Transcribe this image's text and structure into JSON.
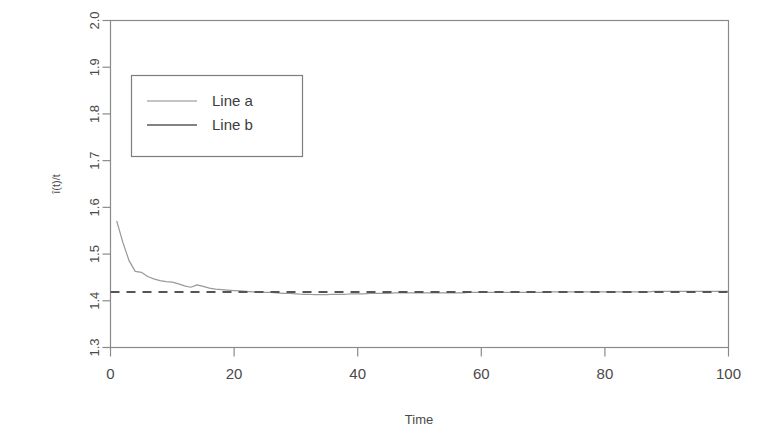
{
  "chart_data": {
    "type": "line",
    "title": "",
    "subtitle": "",
    "xlabel": "Time",
    "ylabel": "î(t)/t",
    "xlim": [
      0,
      100
    ],
    "ylim": [
      1.3,
      2.0
    ],
    "grid": false,
    "legend_position": "upper-left",
    "x_ticks": [
      "0",
      "20",
      "40",
      "60",
      "80",
      "100"
    ],
    "x_tick_values": [
      0,
      20,
      40,
      60,
      80,
      100
    ],
    "y_ticks": [
      "1.3",
      "1.4",
      "1.5",
      "1.6",
      "1.7",
      "1.8",
      "1.9",
      "2.0"
    ],
    "y_tick_values": [
      1.3,
      1.4,
      1.5,
      1.6,
      1.7,
      1.8,
      1.9,
      2.0
    ],
    "legend": [
      "Line a",
      "Line b"
    ],
    "series": [
      {
        "name": "Line a",
        "style": "solid",
        "color": "#9a9a9a",
        "x": [
          1,
          2,
          3,
          4,
          5,
          6,
          7,
          8,
          9,
          10,
          11,
          12,
          13,
          14,
          15,
          16,
          17,
          18,
          19,
          20,
          21,
          22,
          23,
          24,
          25,
          26,
          27,
          28,
          29,
          30,
          31,
          32,
          33,
          34,
          35,
          36,
          37,
          38,
          39,
          40,
          41,
          42,
          43,
          44,
          45,
          46,
          47,
          48,
          49,
          50,
          51,
          52,
          53,
          54,
          55,
          56,
          57,
          58,
          59,
          60,
          61,
          62,
          63,
          64,
          65,
          66,
          67,
          68,
          69,
          70,
          71,
          72,
          73,
          74,
          75,
          76,
          77,
          78,
          79,
          80,
          81,
          82,
          83,
          84,
          85,
          86,
          87,
          88,
          89,
          90,
          91,
          92,
          93,
          94,
          95,
          96,
          97,
          98,
          99,
          100
        ],
        "values": [
          1.571,
          1.525,
          1.486,
          1.463,
          1.461,
          1.452,
          1.447,
          1.443,
          1.441,
          1.44,
          1.436,
          1.432,
          1.429,
          1.434,
          1.431,
          1.427,
          1.425,
          1.424,
          1.423,
          1.422,
          1.421,
          1.42,
          1.419,
          1.419,
          1.418,
          1.418,
          1.417,
          1.416,
          1.416,
          1.415,
          1.414,
          1.414,
          1.413,
          1.413,
          1.413,
          1.414,
          1.414,
          1.414,
          1.415,
          1.415,
          1.415,
          1.416,
          1.416,
          1.416,
          1.416,
          1.417,
          1.417,
          1.417,
          1.417,
          1.417,
          1.417,
          1.417,
          1.417,
          1.417,
          1.417,
          1.417,
          1.417,
          1.418,
          1.418,
          1.418,
          1.418,
          1.418,
          1.418,
          1.418,
          1.418,
          1.418,
          1.418,
          1.418,
          1.418,
          1.418,
          1.419,
          1.419,
          1.419,
          1.419,
          1.419,
          1.419,
          1.419,
          1.419,
          1.419,
          1.419,
          1.419,
          1.419,
          1.419,
          1.419,
          1.419,
          1.419,
          1.419,
          1.42,
          1.42,
          1.42,
          1.42,
          1.42,
          1.42,
          1.42,
          1.42,
          1.42,
          1.42,
          1.42,
          1.42,
          1.42
        ]
      },
      {
        "name": "Line b",
        "style": "dashed",
        "color": "#555555",
        "constant": 1.419,
        "x": [
          0,
          100
        ],
        "values": [
          1.419,
          1.419
        ]
      }
    ]
  },
  "axes": {
    "x_title": "Time",
    "y_title": "î(t)/t"
  },
  "legend_box": {
    "entries": [
      {
        "label": "Line a"
      },
      {
        "label": "Line b"
      }
    ]
  },
  "colors": {
    "frame": "#8a8a8a",
    "line_a": "#9a9a9a",
    "line_b": "#555555",
    "text": "#4a4a4a",
    "background": "#ffffff"
  }
}
